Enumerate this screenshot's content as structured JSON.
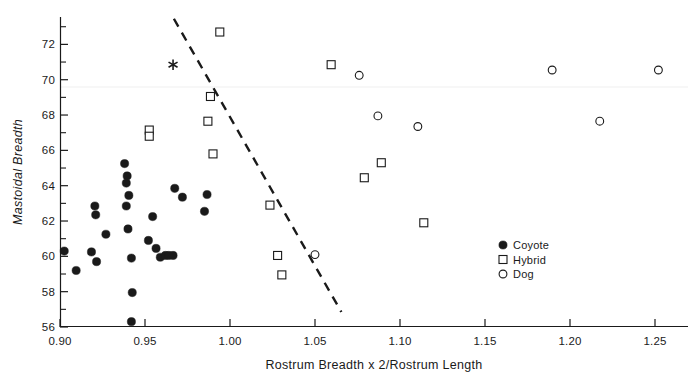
{
  "chart_data": {
    "type": "scatter",
    "title": "",
    "xlabel": "Rostrum Breadth x 2/Rostrum Length",
    "ylabel": "Mastoidal Breadth",
    "xlim": [
      0.8967,
      1.2633
    ],
    "ylim": [
      56,
      73.55
    ],
    "grid": false,
    "xticks": [
      0.9,
      0.95,
      1.0,
      1.05,
      1.1,
      1.15,
      1.2,
      1.25
    ],
    "xtick_labels": [
      "0.90",
      "0.95",
      "1.00",
      "1.05",
      "1.10",
      "1.15",
      "1.20",
      "1.25"
    ],
    "yticks": [
      56,
      58,
      60,
      62,
      64,
      66,
      68,
      70,
      72
    ],
    "ytick_labels": [
      "56",
      "58",
      "60",
      "62",
      "64",
      "66",
      "68",
      "70",
      "72"
    ],
    "y_minor_ticks": [
      57,
      59,
      61,
      63,
      65,
      67,
      69,
      71,
      73
    ],
    "legend_position": "right-lower",
    "series": [
      {
        "name": "Coyote",
        "marker": "filled-circle",
        "color": "#1a1a1a",
        "points": [
          [
            0.9025,
            60.3
          ],
          [
            0.9095,
            59.2
          ],
          [
            0.9185,
            60.25
          ],
          [
            0.9205,
            62.85
          ],
          [
            0.921,
            62.35
          ],
          [
            0.9215,
            59.7
          ],
          [
            0.927,
            61.25
          ],
          [
            0.938,
            65.25
          ],
          [
            0.9395,
            64.55
          ],
          [
            0.939,
            64.15
          ],
          [
            0.9405,
            63.45
          ],
          [
            0.939,
            62.85
          ],
          [
            0.94,
            61.55
          ],
          [
            0.942,
            59.9
          ],
          [
            0.9425,
            57.95
          ],
          [
            0.942,
            56.3
          ],
          [
            0.952,
            60.9
          ],
          [
            0.9545,
            62.25
          ],
          [
            0.9565,
            60.45
          ],
          [
            0.959,
            59.95
          ],
          [
            0.962,
            60.05
          ],
          [
            0.964,
            60.05
          ],
          [
            0.9665,
            60.05
          ],
          [
            0.9675,
            63.85
          ],
          [
            0.972,
            63.35
          ],
          [
            0.9865,
            63.5
          ],
          [
            0.985,
            62.55
          ]
        ]
      },
      {
        "name": "Hybrid",
        "marker": "open-square",
        "color": "#1a1a1a",
        "points": [
          [
            0.9525,
            67.15
          ],
          [
            0.9525,
            66.8
          ],
          [
            0.987,
            67.65
          ],
          [
            0.9885,
            69.05
          ],
          [
            0.99,
            65.8
          ],
          [
            0.994,
            72.7
          ],
          [
            1.0235,
            62.9
          ],
          [
            1.028,
            60.05
          ],
          [
            1.0305,
            58.95
          ],
          [
            1.0595,
            70.85
          ],
          [
            1.079,
            64.45
          ],
          [
            1.089,
            65.3
          ],
          [
            1.114,
            61.9
          ]
        ]
      },
      {
        "name": "Dog",
        "marker": "open-circle",
        "color": "#1a1a1a",
        "points": [
          [
            1.05,
            60.1
          ],
          [
            1.076,
            70.25
          ],
          [
            1.087,
            67.95
          ],
          [
            1.1105,
            67.35
          ],
          [
            1.1895,
            70.55
          ],
          [
            1.2175,
            67.65
          ],
          [
            1.252,
            70.55
          ]
        ]
      }
    ],
    "annotations": [
      {
        "type": "star",
        "label": "*",
        "x": 0.9665,
        "y": 70.85
      },
      {
        "type": "discriminant-line",
        "style": "dashed",
        "from": [
          0.967,
          73.45
        ],
        "to": [
          1.0655,
          56.85
        ]
      }
    ]
  },
  "legend": {
    "entries": [
      {
        "marker": "filled-circle",
        "label": "Coyote"
      },
      {
        "marker": "open-square",
        "label": "Hybrid"
      },
      {
        "marker": "open-circle",
        "label": "Dog"
      }
    ]
  }
}
